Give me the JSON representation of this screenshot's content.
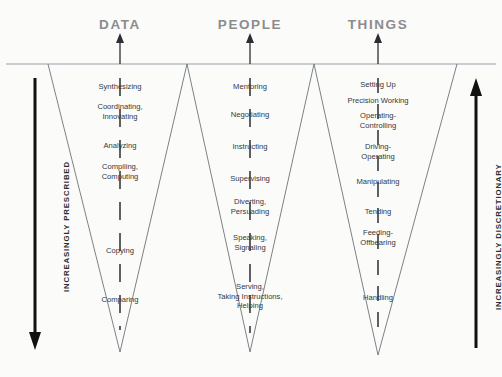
{
  "diagram": {
    "divider_y": 64,
    "colors": {
      "header_gray": "#8c8c8c",
      "rule_gray": "#9aa0a4",
      "funnel_line": "#6e7479",
      "text_dark": "#33383d",
      "arrow_black": "#1a1a1a",
      "background": "#fbfbfa"
    },
    "axes": {
      "left": {
        "label": "INCREASINGLY PRESCRIBED",
        "direction": "down",
        "x": 35,
        "y_top": 78,
        "y_bottom": 344
      },
      "right": {
        "label": "INCREASINGLY DISCRETIONARY",
        "direction": "up",
        "x": 476,
        "y_top": 80,
        "y_bottom": 344
      }
    },
    "columns": [
      {
        "id": "data",
        "header": "DATA",
        "header_x": 120,
        "header_y": 17,
        "center_x": 120,
        "top_left_x": 48,
        "top_right_x": 187,
        "tip_x": 120,
        "tip_y": 352,
        "arrow_x": 120,
        "levels": [
          {
            "label": "Synthesizing",
            "y": 87
          },
          {
            "label": "Coordinating,\nInnovating",
            "y": 112
          },
          {
            "label": "Analyzing",
            "y": 146
          },
          {
            "label": "Compiling,\nComputing",
            "y": 172
          },
          {
            "label": "Copying",
            "y": 251
          },
          {
            "label": "Comparing",
            "y": 300
          }
        ]
      },
      {
        "id": "people",
        "header": "PEOPLE",
        "header_x": 250,
        "header_y": 17,
        "center_x": 250,
        "top_left_x": 187,
        "top_right_x": 314,
        "tip_x": 250,
        "tip_y": 352,
        "arrow_x": 250,
        "levels": [
          {
            "label": "Mentoring",
            "y": 87
          },
          {
            "label": "Negotiating",
            "y": 115
          },
          {
            "label": "Instructing",
            "y": 147
          },
          {
            "label": "Supervising",
            "y": 179
          },
          {
            "label": "Diverting,\nPersuading",
            "y": 207
          },
          {
            "label": "Speaking,\nSignaling",
            "y": 243
          },
          {
            "label": "Serving,\nTaking Instructions,\nHelping",
            "y": 296
          }
        ]
      },
      {
        "id": "things",
        "header": "THINGS",
        "header_x": 378,
        "header_y": 17,
        "center_x": 378,
        "top_left_x": 314,
        "top_right_x": 457,
        "tip_x": 378,
        "tip_y": 355,
        "arrow_x": 378,
        "levels": [
          {
            "label": "Setting Up",
            "y": 85
          },
          {
            "label": "Precision Working",
            "y": 101
          },
          {
            "label": "Operating-\nControlling",
            "y": 121
          },
          {
            "label": "Driving-\nOperating",
            "y": 152
          },
          {
            "label": "Manipulating",
            "y": 182
          },
          {
            "label": "Tending",
            "y": 212
          },
          {
            "label": "Feeding-\nOffbearing",
            "y": 238
          },
          {
            "label": "Handling",
            "y": 298
          }
        ]
      }
    ]
  }
}
